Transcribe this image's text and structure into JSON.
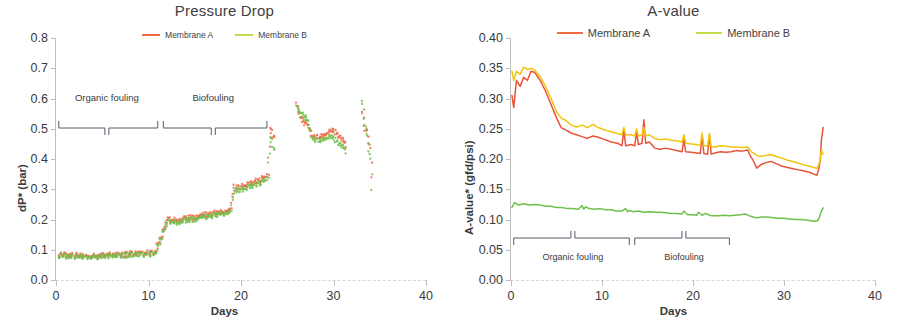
{
  "figure": {
    "panels": [
      "pressure-drop",
      "a-value"
    ]
  },
  "charts": [
    {
      "id": "pressure-drop",
      "title": "Pressure Drop",
      "xlabel": "Days",
      "ylabel": "dP* (bar)",
      "xticks": [
        "0",
        "10",
        "20",
        "30",
        "40"
      ],
      "yticks": [
        "0.0",
        "0.1",
        "0.2",
        "0.3",
        "0.4",
        "0.5",
        "0.6",
        "0.7",
        "0.8"
      ],
      "legend": [
        {
          "label": "Membrane A",
          "color": "#ef6a45"
        },
        {
          "label": "Membrane B",
          "color": "#c8d94a"
        }
      ],
      "annotations": [
        {
          "label": "Organic fouling"
        },
        {
          "label": "Biofouling"
        }
      ]
    },
    {
      "id": "a-value",
      "title": "A-value",
      "xlabel": "Days",
      "ylabel": "A-value* (gfd/psi)",
      "xticks": [
        "0",
        "10",
        "20",
        "30",
        "40"
      ],
      "yticks": [
        "0.00",
        "0.05",
        "0.10",
        "0.15",
        "0.20",
        "0.25",
        "0.30",
        "0.35",
        "0.40"
      ],
      "legend": [
        {
          "label": "Membrane A",
          "color": "#ef6a45"
        },
        {
          "label": "Membrane B",
          "color": "#c8d94a"
        }
      ],
      "annotations": [
        {
          "label": "Organic fouling"
        },
        {
          "label": "Biofouling"
        }
      ]
    }
  ],
  "chart_data": [
    {
      "type": "scatter",
      "id": "pressure-drop",
      "title": "Pressure Drop",
      "xlabel": "Days",
      "ylabel": "dP* (bar)",
      "xlim": [
        0,
        40
      ],
      "ylim": [
        0.0,
        0.8
      ],
      "xticks": [
        0,
        10,
        20,
        30,
        40
      ],
      "yticks": [
        0.0,
        0.1,
        0.2,
        0.3,
        0.4,
        0.5,
        0.6,
        0.7,
        0.8
      ],
      "grid": false,
      "legend_position": "top-center",
      "annotations": [
        {
          "text": "Organic fouling",
          "x_range": [
            0.3,
            11.0
          ],
          "x_center": 5.5
        },
        {
          "text": "Biofouling",
          "x_range": [
            11.6,
            22.8
          ],
          "x_center": 17.0
        }
      ],
      "series": [
        {
          "name": "Membrane A",
          "color": "#ef6a45",
          "x": [
            0.3,
            0.8,
            1.4,
            2.0,
            2.6,
            3.2,
            3.8,
            5.3,
            5.9,
            6.5,
            7.1,
            7.7,
            8.3,
            8.9,
            9.5,
            10.1,
            10.7,
            12.1,
            12.7,
            13.3,
            14.0,
            14.7,
            15.4,
            16.1,
            16.8,
            17.5,
            18.2,
            18.9,
            19.3,
            19.6,
            20.1,
            20.6,
            21.1,
            21.6,
            22.1,
            22.6,
            22.9,
            23.1,
            23.4,
            23.7,
            26.0,
            26.4,
            26.8,
            27.2,
            27.8,
            28.4,
            29.0,
            29.6,
            30.0,
            30.5,
            31.0,
            31.4,
            33.1,
            33.4,
            33.7,
            34.0,
            34.2
          ],
          "y": [
            0.082,
            0.084,
            0.083,
            0.082,
            0.08,
            0.079,
            0.078,
            0.082,
            0.083,
            0.084,
            0.085,
            0.086,
            0.087,
            0.088,
            0.089,
            0.09,
            0.091,
            0.2,
            0.197,
            0.199,
            0.203,
            0.207,
            0.211,
            0.215,
            0.219,
            0.223,
            0.227,
            0.231,
            0.31,
            0.305,
            0.31,
            0.315,
            0.32,
            0.326,
            0.332,
            0.34,
            0.345,
            0.5,
            0.478,
            0.47,
            0.58,
            0.54,
            0.52,
            0.515,
            0.475,
            0.472,
            0.478,
            0.49,
            0.495,
            0.48,
            0.462,
            0.445,
            0.56,
            0.5,
            0.49,
            0.43,
            0.3
          ]
        },
        {
          "name": "Membrane B",
          "color": "#6ec04a",
          "x": [
            0.3,
            0.8,
            1.4,
            2.0,
            2.6,
            3.2,
            3.8,
            5.3,
            5.9,
            6.5,
            7.1,
            7.7,
            8.3,
            8.9,
            9.5,
            10.1,
            10.7,
            12.1,
            12.7,
            13.3,
            14.0,
            14.7,
            15.4,
            16.1,
            16.8,
            17.5,
            18.2,
            18.9,
            19.3,
            19.6,
            20.1,
            20.6,
            21.1,
            21.6,
            22.1,
            22.6,
            22.9,
            23.1,
            23.4,
            23.7,
            26.0,
            26.4,
            26.8,
            27.2,
            27.8,
            28.4,
            29.0,
            29.6,
            30.0,
            30.5,
            31.0,
            31.4,
            33.1,
            33.4,
            33.7,
            34.0,
            34.2
          ],
          "y": [
            0.078,
            0.079,
            0.078,
            0.077,
            0.076,
            0.075,
            0.075,
            0.078,
            0.079,
            0.08,
            0.081,
            0.082,
            0.083,
            0.084,
            0.085,
            0.086,
            0.087,
            0.192,
            0.19,
            0.192,
            0.196,
            0.2,
            0.204,
            0.208,
            0.212,
            0.216,
            0.22,
            0.224,
            0.3,
            0.296,
            0.3,
            0.305,
            0.31,
            0.316,
            0.322,
            0.328,
            0.335,
            0.47,
            0.448,
            0.42,
            0.57,
            0.555,
            0.54,
            0.53,
            0.465,
            0.46,
            0.465,
            0.472,
            0.47,
            0.455,
            0.44,
            0.425,
            0.595,
            0.52,
            0.47,
            0.395,
            0.255
          ]
        }
      ]
    },
    {
      "type": "line",
      "id": "a-value",
      "title": "A-value",
      "xlabel": "Days",
      "ylabel": "A-value* (gfd/psi)",
      "xlim": [
        0,
        40
      ],
      "ylim": [
        0.0,
        0.4
      ],
      "xticks": [
        0,
        10,
        20,
        30,
        40
      ],
      "yticks": [
        0.0,
        0.05,
        0.1,
        0.15,
        0.2,
        0.25,
        0.3,
        0.35,
        0.4
      ],
      "grid": false,
      "legend_position": "top-center",
      "annotations": [
        {
          "text": "Organic fouling",
          "x_range": [
            0.3,
            13.0
          ],
          "x_center": 6.8
        },
        {
          "text": "Biofouling",
          "x_range": [
            13.6,
            24.0
          ],
          "x_center": 19.0
        }
      ],
      "series": [
        {
          "name": "Membrane A",
          "color": "#e8543a",
          "x": [
            0.1,
            0.3,
            0.6,
            1.0,
            1.4,
            1.8,
            2.2,
            2.6,
            3.2,
            3.8,
            4.4,
            5.0,
            5.5,
            6.0,
            6.6,
            7.2,
            7.8,
            8.4,
            9.0,
            9.6,
            10.3,
            11.0,
            11.7,
            12.2,
            12.4,
            12.6,
            13.2,
            13.6,
            13.8,
            14.0,
            14.4,
            14.6,
            14.8,
            15.2,
            15.8,
            16.4,
            17.0,
            17.6,
            18.2,
            18.8,
            19.0,
            19.2,
            19.8,
            20.4,
            20.8,
            21.0,
            21.2,
            21.6,
            21.8,
            22.0,
            22.4,
            23.0,
            23.6,
            24.2,
            24.8,
            25.4,
            26.0,
            26.3,
            26.6,
            27.0,
            27.4,
            28.0,
            28.6,
            29.2,
            29.8,
            30.4,
            31.0,
            31.6,
            32.2,
            32.8,
            33.3,
            33.6,
            33.8,
            34.0,
            34.1,
            34.3
          ],
          "y": [
            0.305,
            0.285,
            0.33,
            0.32,
            0.335,
            0.33,
            0.345,
            0.343,
            0.33,
            0.312,
            0.29,
            0.268,
            0.252,
            0.248,
            0.243,
            0.24,
            0.237,
            0.234,
            0.238,
            0.236,
            0.232,
            0.228,
            0.226,
            0.222,
            0.248,
            0.222,
            0.224,
            0.222,
            0.245,
            0.224,
            0.226,
            0.265,
            0.226,
            0.228,
            0.218,
            0.216,
            0.218,
            0.216,
            0.214,
            0.212,
            0.232,
            0.212,
            0.211,
            0.21,
            0.209,
            0.238,
            0.209,
            0.208,
            0.24,
            0.208,
            0.21,
            0.212,
            0.211,
            0.212,
            0.214,
            0.213,
            0.215,
            0.205,
            0.198,
            0.185,
            0.19,
            0.194,
            0.196,
            0.192,
            0.188,
            0.186,
            0.184,
            0.182,
            0.18,
            0.178,
            0.175,
            0.173,
            0.182,
            0.2,
            0.23,
            0.252
          ]
        },
        {
          "name": "Membrane B",
          "color": "#f2c40f",
          "x": [
            0.1,
            0.3,
            0.6,
            1.0,
            1.4,
            1.8,
            2.2,
            2.6,
            3.2,
            3.8,
            4.4,
            5.0,
            5.5,
            6.0,
            6.6,
            7.2,
            7.8,
            8.4,
            9.0,
            9.6,
            10.3,
            11.0,
            11.7,
            12.2,
            12.4,
            12.6,
            13.2,
            13.6,
            13.8,
            14.0,
            14.4,
            14.6,
            14.8,
            15.2,
            15.8,
            16.4,
            17.0,
            17.6,
            18.2,
            18.8,
            19.0,
            19.2,
            19.8,
            20.4,
            20.8,
            21.0,
            21.2,
            21.6,
            21.8,
            22.0,
            22.4,
            23.0,
            23.6,
            24.2,
            24.8,
            25.4,
            26.0,
            26.3,
            26.6,
            27.0,
            27.4,
            28.0,
            28.6,
            29.2,
            29.8,
            30.4,
            31.0,
            31.6,
            32.2,
            32.8,
            33.3,
            33.6,
            33.8,
            34.0,
            34.1,
            34.3
          ],
          "y": [
            0.345,
            0.33,
            0.345,
            0.34,
            0.352,
            0.348,
            0.35,
            0.347,
            0.336,
            0.32,
            0.3,
            0.278,
            0.268,
            0.264,
            0.256,
            0.253,
            0.256,
            0.252,
            0.257,
            0.252,
            0.248,
            0.245,
            0.242,
            0.24,
            0.252,
            0.24,
            0.24,
            0.238,
            0.25,
            0.238,
            0.24,
            0.252,
            0.238,
            0.24,
            0.234,
            0.232,
            0.233,
            0.231,
            0.23,
            0.228,
            0.24,
            0.226,
            0.225,
            0.224,
            0.222,
            0.243,
            0.222,
            0.221,
            0.242,
            0.22,
            0.22,
            0.222,
            0.221,
            0.22,
            0.22,
            0.219,
            0.22,
            0.214,
            0.21,
            0.206,
            0.204,
            0.206,
            0.207,
            0.204,
            0.201,
            0.198,
            0.196,
            0.193,
            0.19,
            0.188,
            0.186,
            0.184,
            0.19,
            0.2,
            0.215,
            0.208
          ]
        },
        {
          "name": "Membrane B (green)",
          "color": "#6ec04a",
          "x": [
            0.1,
            0.4,
            0.8,
            1.4,
            2.0,
            2.6,
            3.2,
            3.8,
            4.4,
            5.0,
            5.6,
            6.2,
            6.8,
            7.4,
            7.8,
            8.0,
            8.2,
            8.6,
            9.2,
            9.8,
            10.4,
            11.0,
            11.6,
            12.2,
            12.6,
            12.8,
            13.0,
            13.4,
            14.0,
            14.6,
            15.2,
            15.8,
            16.4,
            17.0,
            17.6,
            18.2,
            18.8,
            19.0,
            19.4,
            20.0,
            20.4,
            20.6,
            21.0,
            21.4,
            21.8,
            22.2,
            22.8,
            23.4,
            24.0,
            24.6,
            25.2,
            25.8,
            26.2,
            26.6,
            27.0,
            27.6,
            28.2,
            28.8,
            29.4,
            30.0,
            30.6,
            31.2,
            31.8,
            32.4,
            33.0,
            33.4,
            33.7,
            33.9,
            34.1,
            34.3
          ],
          "y": [
            0.12,
            0.128,
            0.124,
            0.126,
            0.124,
            0.125,
            0.124,
            0.122,
            0.122,
            0.12,
            0.12,
            0.118,
            0.118,
            0.117,
            0.123,
            0.117,
            0.121,
            0.118,
            0.117,
            0.118,
            0.116,
            0.116,
            0.114,
            0.114,
            0.118,
            0.113,
            0.115,
            0.113,
            0.114,
            0.112,
            0.113,
            0.112,
            0.112,
            0.111,
            0.11,
            0.11,
            0.109,
            0.114,
            0.108,
            0.108,
            0.107,
            0.112,
            0.107,
            0.11,
            0.107,
            0.106,
            0.106,
            0.107,
            0.106,
            0.107,
            0.108,
            0.109,
            0.106,
            0.104,
            0.103,
            0.104,
            0.104,
            0.103,
            0.102,
            0.102,
            0.101,
            0.1,
            0.1,
            0.099,
            0.098,
            0.097,
            0.098,
            0.104,
            0.114,
            0.119
          ]
        }
      ]
    }
  ]
}
